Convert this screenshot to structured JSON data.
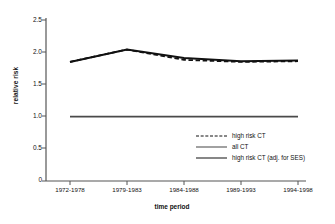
{
  "chart_data": {
    "type": "line",
    "title": "",
    "xlabel": "time period",
    "ylabel": "relative risk",
    "categories": [
      "1972-1978",
      "1979-1983",
      "1984-1988",
      "1989-1993",
      "1994-1998"
    ],
    "ylim": [
      0,
      2.5
    ],
    "yticks": [
      "0",
      "0.5",
      "1.0",
      "1.5",
      "2.0",
      "2.5"
    ],
    "ytick_values": [
      0,
      0.5,
      1.0,
      1.5,
      2.0,
      2.5
    ],
    "grid": false,
    "legend_position": "inside-lower-right",
    "series": [
      {
        "name": "high risk CT",
        "style": "dashed",
        "color": "#111111",
        "values": [
          1.85,
          2.04,
          1.88,
          1.85,
          1.86
        ]
      },
      {
        "name": "all CT",
        "style": "solid-thin",
        "color": "#4a4a4a",
        "values": [
          1.0,
          1.0,
          1.0,
          1.0,
          1.0
        ]
      },
      {
        "name": "high risk CT (adj. for SES)",
        "style": "solid-thick",
        "color": "#111111",
        "values": [
          1.85,
          2.04,
          1.91,
          1.86,
          1.87
        ]
      }
    ]
  },
  "axis": {
    "y_title": "relative risk",
    "x_title": "time period"
  },
  "legend": {
    "items": [
      {
        "label": "high risk CT",
        "swatch": "dashed-line-swatch"
      },
      {
        "label": "all CT",
        "swatch": "thin-line-swatch"
      },
      {
        "label": "high risk CT (adj. for SES)",
        "swatch": "thick-line-swatch"
      }
    ]
  },
  "ticks": {
    "y": [
      "2.5",
      "2.0",
      "1.5",
      "1.0",
      "0.5",
      "0"
    ],
    "x": [
      "1972-1978",
      "1979-1983",
      "1984-1988",
      "1989-1993",
      "1994-1998"
    ]
  }
}
